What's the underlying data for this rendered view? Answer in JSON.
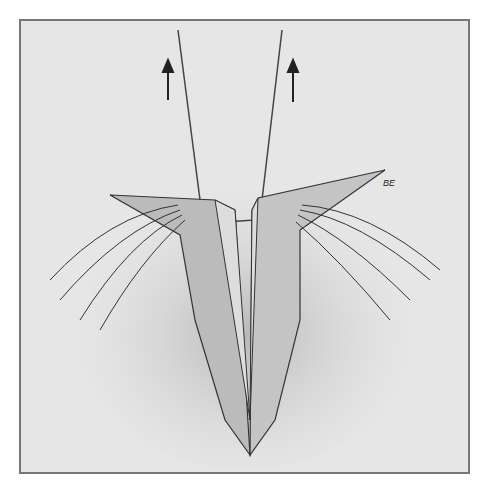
{
  "illustration": {
    "description": "Pencil medical illustration of tissue flaps retracted upward by two sutures",
    "signature": "BE",
    "arrows": [
      "up-arrow-left",
      "up-arrow-right"
    ]
  }
}
